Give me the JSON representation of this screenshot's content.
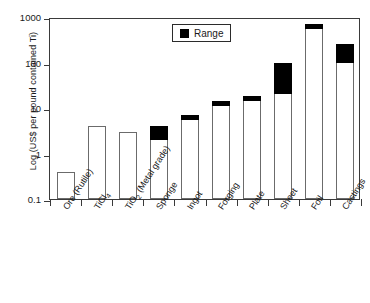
{
  "chart_data": {
    "type": "bar",
    "title": "",
    "xlabel": "",
    "ylabel": "Log (US$ per pound contained Ti)",
    "scale": "log",
    "ylim": [
      0.1,
      1000
    ],
    "yticks": [
      "0.1",
      "1",
      "10",
      "100",
      "1000"
    ],
    "grid": false,
    "legend": {
      "position": "top-center",
      "entries": [
        "Range"
      ]
    },
    "categories": [
      "Ore (Rutile)",
      "TiCl4",
      "TiO2 (Metal grade)",
      "Sponge",
      "Ingot",
      "Forging",
      "Plate",
      "Sheet",
      "Foil",
      "Castings"
    ],
    "category_labels_html": [
      "Ore (Rutile)",
      "TiCl<sub>4</sub>",
      "TiO<sub>2</sub> (Metal grade)",
      "Sponge",
      "Ingot",
      "Forging",
      "Plate",
      "Sheet",
      "Foil",
      "Castings"
    ],
    "values": [
      0.4,
      4,
      3,
      4,
      7,
      14,
      18,
      100,
      700,
      250
    ],
    "series": [
      {
        "name": "Range",
        "low": [
          null,
          null,
          null,
          2.0,
          5.5,
          11,
          14,
          20,
          550,
          100
        ],
        "high": [
          null,
          null,
          null,
          4.0,
          7.0,
          14,
          18,
          100,
          700,
          250
        ]
      }
    ],
    "bars": [
      {
        "category": "Ore (Rutile)",
        "top": 0.4,
        "range_low": null,
        "range_high": null
      },
      {
        "category": "TiCl4",
        "top": 4,
        "range_low": null,
        "range_high": null
      },
      {
        "category": "TiO2 (Metal grade)",
        "top": 3,
        "range_low": null,
        "range_high": null
      },
      {
        "category": "Sponge",
        "top": 4,
        "range_low": 2.0,
        "range_high": 4.0
      },
      {
        "category": "Ingot",
        "top": 7,
        "range_low": 5.5,
        "range_high": 7.0
      },
      {
        "category": "Forging",
        "top": 14,
        "range_low": 11,
        "range_high": 14
      },
      {
        "category": "Plate",
        "top": 18,
        "range_low": 14,
        "range_high": 18
      },
      {
        "category": "Sheet",
        "top": 100,
        "range_low": 20,
        "range_high": 100
      },
      {
        "category": "Foil",
        "top": 700,
        "range_low": 550,
        "range_high": 700
      },
      {
        "category": "Castings",
        "top": 250,
        "range_low": 100,
        "range_high": 250
      }
    ]
  },
  "colors": {
    "range_fill": "#000000",
    "bar_fill": "#ffffff",
    "bar_stroke": "#6b6b6b",
    "axis": "#3a3a3a",
    "background": "#ffffff"
  }
}
